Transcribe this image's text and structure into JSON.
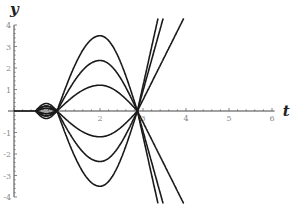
{
  "chart_data": {
    "type": "line",
    "title": "",
    "xlabel": "t",
    "ylabel": "y",
    "xlim": [
      0,
      6.2
    ],
    "ylim": [
      -4,
      4
    ],
    "xticks": [
      {
        "value": 2,
        "label": "2"
      },
      {
        "value": 3,
        "label": "3"
      },
      {
        "value": 4,
        "label": "4"
      },
      {
        "value": 5,
        "label": "5"
      },
      {
        "value": 6,
        "label": "6"
      }
    ],
    "yticks": [
      {
        "value": 4,
        "label": "4"
      },
      {
        "value": 3,
        "label": "3"
      },
      {
        "value": 2,
        "label": "2"
      },
      {
        "value": 1,
        "label": "1"
      },
      {
        "value": -1,
        "label": "-1"
      },
      {
        "value": -2,
        "label": "-2"
      },
      {
        "value": -3,
        "label": "-3"
      },
      {
        "value": -4,
        "label": "-4"
      }
    ],
    "grid": false,
    "legend": "none",
    "series": [
      {
        "name": "curve A=+1.2",
        "amplitude": 1.2,
        "post_slope": 4.0
      },
      {
        "name": "curve A=+2.35",
        "amplitude": 2.35,
        "post_slope": 7.2
      },
      {
        "name": "curve A=+3.5",
        "amplitude": 3.5,
        "post_slope": 9.0
      },
      {
        "name": "curve A=-1.2",
        "amplitude": -1.2,
        "post_slope": -4.0
      },
      {
        "name": "curve A=-2.35",
        "amplitude": -2.35,
        "post_slope": -7.2
      },
      {
        "name": "curve A=-3.5",
        "amplitude": -3.5,
        "post_slope": -9.0
      }
    ],
    "zero_crossings": [
      1.0,
      2.87
    ],
    "extremum_t": 2.0,
    "left_lobe": {
      "t_start": 0.5,
      "t_end": 1.0,
      "max_amplitude": 0.35
    }
  }
}
